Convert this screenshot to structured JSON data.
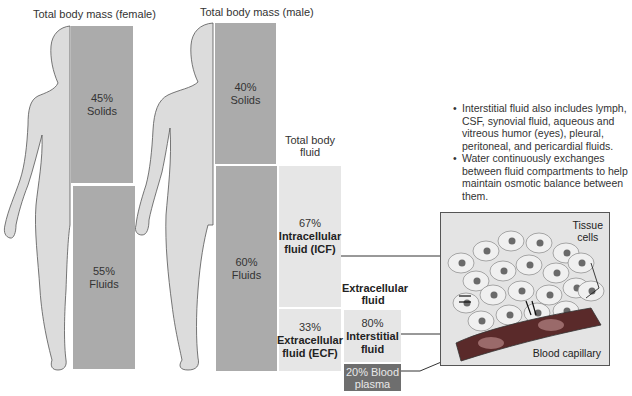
{
  "female": {
    "title": "Total body mass (female)",
    "solids": {
      "percent": "45%",
      "label": "Solids"
    },
    "fluids": {
      "percent": "55%",
      "label": "Fluids"
    }
  },
  "male": {
    "title": "Total body mass (male)",
    "solids": {
      "percent": "40%",
      "label": "Solids"
    },
    "fluids": {
      "percent": "60%",
      "label": "Fluids"
    }
  },
  "total_body_fluid": {
    "title_line1": "Total body",
    "title_line2": "fluid",
    "icf": {
      "percent": "67%",
      "label_line1": "Intracellular",
      "label_line2": "fluid (ICF)"
    },
    "ecf": {
      "percent": "33%",
      "label_line1": "Extracellular",
      "label_line2": "fluid (ECF)"
    }
  },
  "extracellular_fluid": {
    "title_line1": "Extracellular",
    "title_line2": "fluid",
    "interstitial": {
      "percent": "80%",
      "label_line1": "Interstitial",
      "label_line2": "fluid"
    },
    "plasma": {
      "line1": "20% Blood",
      "line2": "plasma"
    }
  },
  "notes": [
    "Interstitial fluid also includes lymph, CSF, synovial fluid, aqueous and vitreous humor (eyes), pleural, peritoneal, and pericardial fluids.",
    "Water continuously exchanges between fluid compartments to help maintain osmotic balance between them."
  ],
  "illustration": {
    "tissue_cells_line1": "Tissue",
    "tissue_cells_line2": "cells",
    "blood_capillary": "Blood capillary"
  },
  "colors": {
    "body": "#dcdcdc",
    "dark_box": "#ababab",
    "light_box": "#e6e6e6",
    "plasma_box": "#6e6e6e",
    "capillary": "#7a2e2e"
  }
}
